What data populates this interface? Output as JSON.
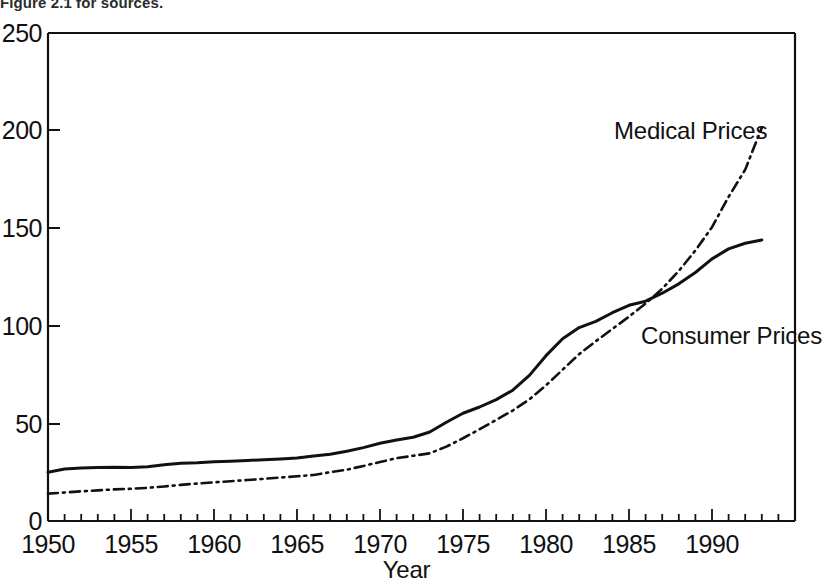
{
  "caption": {
    "text": "Figure 2.1 for sources."
  },
  "axes": {
    "x_title": "Year",
    "y_title": "",
    "x_ticks": [
      "1950",
      "1955",
      "1960",
      "1965",
      "1970",
      "1975",
      "1980",
      "1985",
      "1990"
    ],
    "y_ticks": [
      "0",
      "50",
      "100",
      "150",
      "200",
      "250"
    ]
  },
  "annotations": {
    "medical": "Medical Prices",
    "consumer": "Consumer Prices"
  },
  "colors": {
    "axis": "#111111",
    "consumer_line": "#111111",
    "medical_line": "#111111",
    "background": "#ffffff"
  },
  "chart_data": {
    "type": "line",
    "title": "",
    "subtitle": "",
    "xlabel": "Year",
    "ylabel": "",
    "xlim": [
      1950,
      1995
    ],
    "ylim": [
      0,
      250
    ],
    "grid": false,
    "legend_position": "inline-annotation",
    "x_tick_interval_major": 5,
    "x_tick_interval_minor": 1,
    "y_tick_interval": 50,
    "x": [
      1950,
      1951,
      1952,
      1953,
      1954,
      1955,
      1956,
      1957,
      1958,
      1959,
      1960,
      1961,
      1962,
      1963,
      1964,
      1965,
      1966,
      1967,
      1968,
      1969,
      1970,
      1971,
      1972,
      1973,
      1974,
      1975,
      1976,
      1977,
      1978,
      1979,
      1980,
      1981,
      1982,
      1983,
      1984,
      1985,
      1986,
      1987,
      1988,
      1989,
      1990,
      1991,
      1992,
      1993
    ],
    "series": [
      {
        "name": "Consumer Prices",
        "style": "solid",
        "values": [
          25.0,
          26.6,
          27.2,
          27.4,
          27.5,
          27.4,
          27.8,
          28.8,
          29.6,
          29.8,
          30.3,
          30.6,
          31.0,
          31.4,
          31.8,
          32.3,
          33.3,
          34.2,
          35.7,
          37.6,
          39.8,
          41.5,
          42.9,
          45.6,
          50.6,
          55.2,
          58.4,
          62.2,
          67.0,
          74.6,
          84.7,
          93.4,
          99.1,
          102.3,
          106.7,
          110.5,
          112.6,
          116.7,
          121.5,
          127.3,
          134.3,
          139.4,
          142.3,
          144.0
        ]
      },
      {
        "name": "Medical Prices",
        "style": "dash-dot",
        "values": [
          14.0,
          14.6,
          15.2,
          15.7,
          16.2,
          16.5,
          17.0,
          17.7,
          18.5,
          19.2,
          19.8,
          20.4,
          21.0,
          21.6,
          22.3,
          22.9,
          23.6,
          25.0,
          26.3,
          28.2,
          30.2,
          32.2,
          33.4,
          34.7,
          38.1,
          42.4,
          47.0,
          51.8,
          56.6,
          62.3,
          69.5,
          77.5,
          85.5,
          92.1,
          98.4,
          104.7,
          111.4,
          119.0,
          128.1,
          138.6,
          150.5,
          166.1,
          180.0,
          201.5
        ]
      }
    ]
  }
}
